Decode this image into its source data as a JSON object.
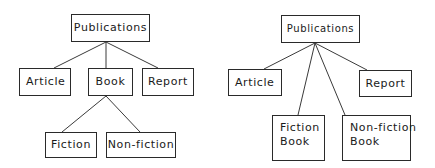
{
  "diagrams": [
    {
      "name": "hierarchy-with-book-subclass",
      "root": "Publications",
      "level1": [
        "Article",
        "Book",
        "Report"
      ],
      "book_children": [
        "Fiction",
        "Non-fiction"
      ]
    },
    {
      "name": "flattened-hierarchy",
      "root": "Publications",
      "children": [
        {
          "line1": "Article"
        },
        {
          "line1": "Fiction",
          "line2": "Book"
        },
        {
          "line1": "Non-fiction",
          "line2": "Book"
        },
        {
          "line1": "Report"
        }
      ]
    }
  ],
  "colors": {
    "line": "#3a3a3a",
    "border": "#2a2a2a",
    "text": "#1a1a1a",
    "background": "#ffffff"
  }
}
